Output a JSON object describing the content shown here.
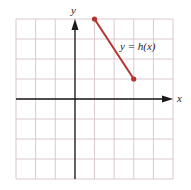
{
  "chart_data": {
    "type": "line",
    "title": "",
    "xlabel": "x",
    "ylabel": "y",
    "xlim": [
      -3,
      5
    ],
    "ylim": [
      -4,
      4
    ],
    "grid": true,
    "grid_step": 1,
    "series": [
      {
        "name": "y = h(x)",
        "x": [
          1,
          3
        ],
        "y": [
          4,
          1
        ],
        "color": "#b3342f",
        "endpoints": "closed"
      }
    ],
    "annotations": [
      {
        "text": "y = h(x)",
        "x": 3.5,
        "y": 2.9
      }
    ]
  },
  "labels": {
    "x_axis": "x",
    "y_axis": "y",
    "function": "y = h(x)"
  }
}
